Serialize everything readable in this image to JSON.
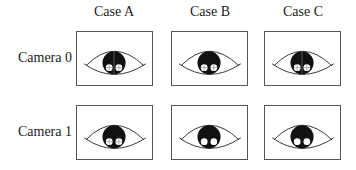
{
  "columns": [
    {
      "label": "Case A"
    },
    {
      "label": "Case B"
    },
    {
      "label": "Case C"
    }
  ],
  "rows": [
    {
      "label": "Camera 0",
      "cells": [
        {
          "case": "A",
          "pupil": "black",
          "glints": "crosshair",
          "center_line": true
        },
        {
          "case": "B",
          "pupil": "black",
          "glints": "crosshair",
          "center_line": false
        },
        {
          "case": "C",
          "pupil": "black",
          "glints": "crosshair",
          "center_line": true
        }
      ]
    },
    {
      "label": "Camera 1",
      "cells": [
        {
          "case": "A",
          "pupil": "black",
          "glints": "crosshair",
          "center_line": false
        },
        {
          "case": "B",
          "pupil": "black",
          "glints": "plain",
          "center_line": false
        },
        {
          "case": "C",
          "pupil": "black",
          "glints": "plain",
          "center_line": false
        }
      ]
    }
  ],
  "colors": {
    "stroke": "#333333",
    "pupil": "#111111",
    "glint": "#ffffff"
  }
}
